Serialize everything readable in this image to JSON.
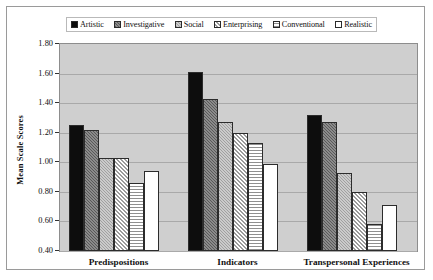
{
  "chart_data": {
    "type": "bar",
    "title": "",
    "xlabel": "",
    "ylabel": "Mean Scale Scores",
    "ylim": [
      0.4,
      1.8
    ],
    "ytick_step": 0.2,
    "yticks": [
      "1.80",
      "1.60",
      "1.40",
      "1.20",
      "1.00",
      "0.80",
      "0.60",
      "0.40"
    ],
    "grid": true,
    "legend_position": "top",
    "categories": [
      "Predispositions",
      "Indicators",
      "Transpersonal Experiences"
    ],
    "series": [
      {
        "name": "Artistic",
        "pattern": "solid-black",
        "values": [
          1.25,
          1.61,
          1.32
        ]
      },
      {
        "name": "Investigative",
        "pattern": "dark-gray-hatch",
        "values": [
          1.22,
          1.43,
          1.27
        ]
      },
      {
        "name": "Social",
        "pattern": "mid-gray-hatch",
        "values": [
          1.03,
          1.27,
          0.93
        ]
      },
      {
        "name": "Enterprising",
        "pattern": "light-diagonal",
        "values": [
          1.03,
          1.2,
          0.8
        ]
      },
      {
        "name": "Conventional",
        "pattern": "horizontal-hatch",
        "values": [
          0.86,
          1.13,
          0.58
        ]
      },
      {
        "name": "Realistic",
        "pattern": "white-open",
        "values": [
          0.94,
          0.99,
          0.71
        ]
      }
    ],
    "colors": {
      "plot_background": "#cfcfcf",
      "gridline": "#a9a9a9",
      "page_background": "#ffffff",
      "border": "#8d8d8d",
      "text": "#111111"
    }
  }
}
